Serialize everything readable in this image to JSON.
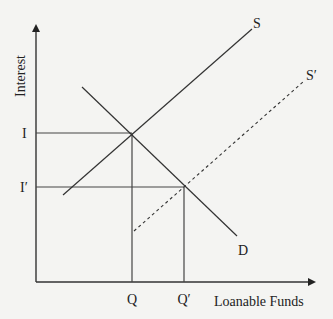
{
  "diagram": {
    "axes": {
      "y_label": "Interest",
      "x_label": "Loanable Funds"
    },
    "curves": [
      {
        "id": "S",
        "label": "S",
        "style": "solid",
        "type": "supply"
      },
      {
        "id": "S_prime",
        "label": "S′",
        "style": "dashed",
        "type": "supply"
      },
      {
        "id": "D",
        "label": "D",
        "style": "solid",
        "type": "demand"
      }
    ],
    "equilibria": [
      {
        "interest_label": "I",
        "quantity_label": "Q",
        "curves": [
          "S",
          "D"
        ]
      },
      {
        "interest_label": "I′",
        "quantity_label": "Q′",
        "curves": [
          "S_prime",
          "D"
        ]
      }
    ]
  },
  "labels": {
    "y_axis": "Interest",
    "x_axis": "Loanable Funds",
    "S": "S",
    "S_prime": "S′",
    "D": "D",
    "I": "I",
    "I_prime": "I′",
    "Q": "Q",
    "Q_prime": "Q′"
  }
}
